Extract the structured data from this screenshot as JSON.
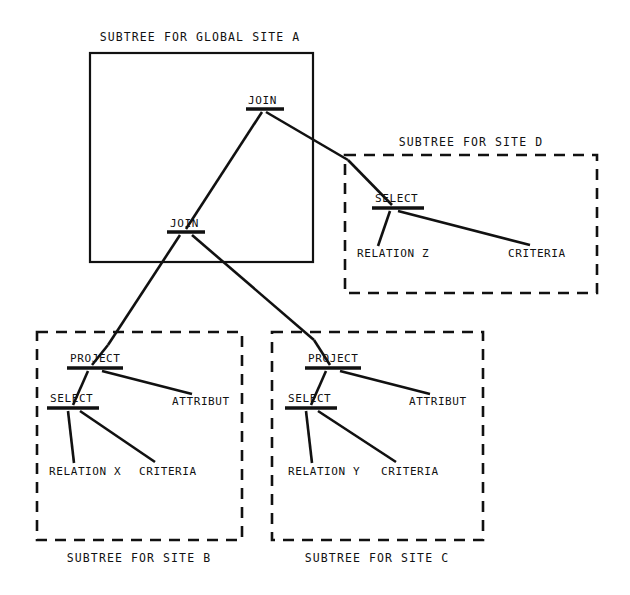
{
  "diagram": {
    "title_text": "Distributed query tree decomposed into site subtrees",
    "regions": [
      {
        "id": "site-a",
        "caption": "SUBTREE FOR GLOBAL SITE A",
        "border": "solid",
        "caption_position": "top",
        "box": {
          "x": 90,
          "y": 53,
          "w": 223,
          "h": 209
        },
        "caption_xy": {
          "x": 200,
          "y": 37
        }
      },
      {
        "id": "site-d",
        "caption": "SUBTREE FOR SITE D",
        "border": "dashed",
        "caption_position": "top",
        "box": {
          "x": 345,
          "y": 155,
          "w": 252,
          "h": 138
        },
        "caption_xy": {
          "x": 471,
          "y": 142
        }
      },
      {
        "id": "site-b",
        "caption": "SUBTREE FOR SITE B",
        "border": "dashed",
        "caption_position": "bottom",
        "box": {
          "x": 37,
          "y": 332,
          "w": 205,
          "h": 208
        },
        "caption_xy": {
          "x": 139,
          "y": 558
        }
      },
      {
        "id": "site-c",
        "caption": "SUBTREE FOR SITE C",
        "border": "dashed",
        "caption_position": "bottom",
        "box": {
          "x": 272,
          "y": 332,
          "w": 211,
          "h": 208
        },
        "caption_xy": {
          "x": 377,
          "y": 558
        }
      }
    ],
    "nodes": [
      {
        "id": "join-top",
        "label": "JOIN",
        "kind": "operator",
        "region": "site-a",
        "text_xy": {
          "x": 248,
          "y": 101
        },
        "bar": {
          "x1": 246,
          "x2": 284,
          "y": 109
        }
      },
      {
        "id": "join-lower",
        "label": "JOIN",
        "kind": "operator",
        "region": "site-a",
        "text_xy": {
          "x": 170,
          "y": 224
        },
        "bar": {
          "x1": 167,
          "x2": 205,
          "y": 232
        }
      },
      {
        "id": "select-d",
        "label": "SELECT",
        "kind": "operator",
        "region": "site-d",
        "text_xy": {
          "x": 375,
          "y": 199
        },
        "bar": {
          "x1": 372,
          "x2": 424,
          "y": 208
        }
      },
      {
        "id": "relation-z",
        "label": "RELATION Z",
        "kind": "leaf",
        "region": "site-d",
        "text_xy": {
          "x": 357,
          "y": 254
        },
        "bar": null
      },
      {
        "id": "criteria-d",
        "label": "CRITERIA",
        "kind": "leaf",
        "region": "site-d",
        "text_xy": {
          "x": 508,
          "y": 254
        },
        "bar": null
      },
      {
        "id": "project-b",
        "label": "PROJECT",
        "kind": "operator",
        "region": "site-b",
        "text_xy": {
          "x": 70,
          "y": 359
        },
        "bar": {
          "x1": 67,
          "x2": 123,
          "y": 368
        }
      },
      {
        "id": "select-b",
        "label": "SELECT",
        "kind": "operator",
        "region": "site-b",
        "text_xy": {
          "x": 50,
          "y": 399
        },
        "bar": {
          "x1": 47,
          "x2": 99,
          "y": 408
        }
      },
      {
        "id": "attribut-b",
        "label": "ATTRIBUT",
        "kind": "leaf",
        "region": "site-b",
        "text_xy": {
          "x": 172,
          "y": 402
        },
        "bar": null
      },
      {
        "id": "relation-x",
        "label": "RELATION X",
        "kind": "leaf",
        "region": "site-b",
        "text_xy": {
          "x": 49,
          "y": 472
        },
        "bar": null
      },
      {
        "id": "criteria-b",
        "label": "CRITERIA",
        "kind": "leaf",
        "region": "site-b",
        "text_xy": {
          "x": 139,
          "y": 472
        },
        "bar": null
      },
      {
        "id": "project-c",
        "label": "PROJECT",
        "kind": "operator",
        "region": "site-c",
        "text_xy": {
          "x": 308,
          "y": 359
        },
        "bar": {
          "x1": 305,
          "x2": 361,
          "y": 368
        }
      },
      {
        "id": "select-c",
        "label": "SELECT",
        "kind": "operator",
        "region": "site-c",
        "text_xy": {
          "x": 288,
          "y": 399
        },
        "bar": {
          "x1": 285,
          "x2": 337,
          "y": 408
        }
      },
      {
        "id": "attribut-c",
        "label": "ATTRIBUT",
        "kind": "leaf",
        "region": "site-c",
        "text_xy": {
          "x": 409,
          "y": 402
        },
        "bar": null
      },
      {
        "id": "relation-y",
        "label": "RELATION Y",
        "kind": "leaf",
        "region": "site-c",
        "text_xy": {
          "x": 288,
          "y": 472
        },
        "bar": null
      },
      {
        "id": "criteria-c",
        "label": "CRITERIA",
        "kind": "leaf",
        "region": "site-c",
        "text_xy": {
          "x": 381,
          "y": 472
        },
        "bar": null
      }
    ],
    "edges": [
      {
        "id": "edge-join-top-to-join-lower",
        "from": "join-top",
        "to": "join-lower",
        "x1": 262,
        "y1": 112,
        "x2": 186,
        "y2": 229
      },
      {
        "id": "edge-join-top-to-site-d",
        "from": "join-top",
        "to": "site-d",
        "x1": 266,
        "y1": 112,
        "x2": 348,
        "y2": 160
      },
      {
        "id": "edge-site-d-to-select-d",
        "from": "site-d",
        "to": "select-d",
        "x1": 348,
        "y1": 160,
        "x2": 392,
        "y2": 205
      },
      {
        "id": "edge-select-d-to-relation-z",
        "from": "select-d",
        "to": "relation-z",
        "x1": 390,
        "y1": 211,
        "x2": 378,
        "y2": 246
      },
      {
        "id": "edge-select-d-to-criteria-d",
        "from": "select-d",
        "to": "criteria-d",
        "x1": 398,
        "y1": 211,
        "x2": 530,
        "y2": 245
      },
      {
        "id": "edge-join-lower-to-site-b",
        "from": "join-lower",
        "to": "site-b",
        "x1": 180,
        "y1": 235,
        "x2": 108,
        "y2": 345
      },
      {
        "id": "edge-site-b-to-project-b",
        "from": "site-b",
        "to": "project-b",
        "x1": 108,
        "y1": 345,
        "x2": 92,
        "y2": 365
      },
      {
        "id": "edge-join-lower-to-site-c",
        "from": "join-lower",
        "to": "site-c",
        "x1": 192,
        "y1": 235,
        "x2": 314,
        "y2": 340
      },
      {
        "id": "edge-site-c-to-project-c",
        "from": "site-c",
        "to": "project-c",
        "x1": 314,
        "y1": 340,
        "x2": 330,
        "y2": 365
      },
      {
        "id": "edge-project-b-to-select-b",
        "from": "project-b",
        "to": "select-b",
        "x1": 88,
        "y1": 371,
        "x2": 73,
        "y2": 405
      },
      {
        "id": "edge-project-b-to-attribut-b",
        "from": "project-b",
        "to": "attribut-b",
        "x1": 102,
        "y1": 371,
        "x2": 192,
        "y2": 394
      },
      {
        "id": "edge-select-b-to-relation-x",
        "from": "select-b",
        "to": "relation-x",
        "x1": 68,
        "y1": 411,
        "x2": 74,
        "y2": 463
      },
      {
        "id": "edge-select-b-to-criteria-b",
        "from": "select-b",
        "to": "criteria-b",
        "x1": 80,
        "y1": 411,
        "x2": 155,
        "y2": 462
      },
      {
        "id": "edge-project-c-to-select-c",
        "from": "project-c",
        "to": "select-c",
        "x1": 326,
        "y1": 371,
        "x2": 311,
        "y2": 405
      },
      {
        "id": "edge-project-c-to-attribut-c",
        "from": "project-c",
        "to": "attribut-c",
        "x1": 340,
        "y1": 371,
        "x2": 430,
        "y2": 394
      },
      {
        "id": "edge-select-c-to-relation-y",
        "from": "select-c",
        "to": "relation-y",
        "x1": 306,
        "y1": 411,
        "x2": 312,
        "y2": 463
      },
      {
        "id": "edge-select-c-to-criteria-y",
        "from": "select-c",
        "to": "criteria-c",
        "x1": 318,
        "y1": 411,
        "x2": 396,
        "y2": 462
      }
    ],
    "colors": {
      "ink": "#111111",
      "background": "#ffffff"
    }
  }
}
